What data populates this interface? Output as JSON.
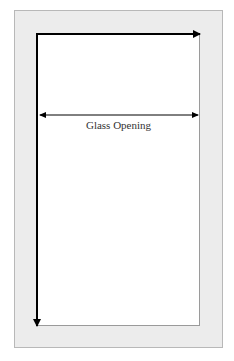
{
  "diagram": {
    "label": "Glass Opening",
    "colors": {
      "frame": "#ececec",
      "frame_border": "#b8b8b8",
      "glass": "#ffffff",
      "arrow": "#000000"
    },
    "arrows": [
      {
        "name": "width-arrow",
        "direction": "right"
      },
      {
        "name": "height-arrow",
        "direction": "down"
      },
      {
        "name": "glass-opening-dimension",
        "direction": "both"
      }
    ]
  }
}
